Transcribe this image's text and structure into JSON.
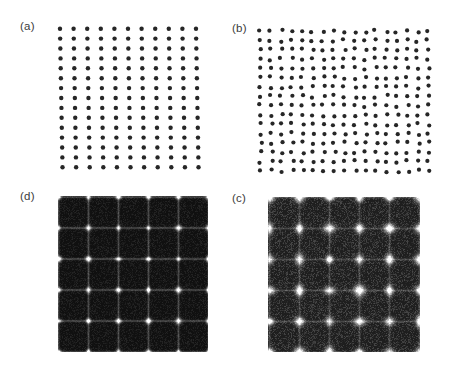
{
  "figure": {
    "background_color": "#ffffff",
    "label_color": "#3b3b3b",
    "dot_color": "#262626",
    "panel_order": [
      "a",
      "b",
      "d",
      "c"
    ]
  },
  "panels": {
    "a": {
      "label": "(a)",
      "kind": "real-space-lattice",
      "caption_position": "top-left",
      "description": "regular square lattice of dark circular dots",
      "bounds": {
        "x": 54,
        "y": 22,
        "width": 148,
        "height": 152
      },
      "dot_color": "#262626",
      "background_color": "#ffffff"
    },
    "b": {
      "label": "(b)",
      "kind": "real-space-lattice",
      "caption_position": "top-left",
      "description": "denser, slightly disordered square lattice of dark circular dots",
      "bounds": {
        "x": 254,
        "y": 24,
        "width": 180,
        "height": 154
      },
      "dot_color": "#262626",
      "background_color": "#ffffff"
    },
    "d": {
      "label": "(d)",
      "kind": "fourier-transform",
      "caption_position": "top-left",
      "description": "dark diffraction pattern with sharp bright Bragg peaks on a square grid joined by faint streak lines",
      "bounds": {
        "x": 58,
        "y": 196,
        "width": 150,
        "height": 156
      },
      "background_color": "#070707",
      "peak_color": "#ffffff"
    },
    "c": {
      "label": "(c)",
      "kind": "fourier-transform",
      "caption_position": "top-left",
      "description": "dark diffraction pattern with diffuse, smeared peaks on a square grid and a grainier background",
      "bounds": {
        "x": 268,
        "y": 197,
        "width": 152,
        "height": 155
      },
      "background_color": "#0d0d0d",
      "peak_color": "#f2f2f2"
    }
  },
  "chart_data": {
    "type": "scatter",
    "title": "",
    "xlabel": "",
    "ylabel": "",
    "subplots": [
      {
        "id": "a",
        "label": "(a)",
        "type": "scatter",
        "description": "Regular 2D square point lattice, slight global tilt",
        "lattice": {
          "columns": 11,
          "rows": 15,
          "spacing_x": 13.6,
          "spacing_y": 9.9,
          "shear_per_row": 0.18,
          "jitter": 0.0,
          "dot_radius": 2.2
        },
        "xlim": [
          0,
          148
        ],
        "ylim": [
          0,
          152
        ],
        "grid": false
      },
      {
        "id": "b",
        "label": "(b)",
        "type": "scatter",
        "description": "Denser square point lattice with random positional disorder",
        "lattice": {
          "columns": 17,
          "rows": 16,
          "spacing_x": 10.5,
          "spacing_y": 9.3,
          "shear_per_row": 0.06,
          "jitter": 1.5,
          "dot_radius": 2.1
        },
        "xlim": [
          0,
          180
        ],
        "ylim": [
          0,
          154
        ],
        "grid": false
      },
      {
        "id": "d",
        "label": "(d)",
        "type": "heatmap",
        "description": "Fourier transform of (a): sharp bright peaks on a 6x6 reciprocal grid",
        "peak_grid": {
          "columns": 6,
          "rows": 6,
          "spacing_x": 30,
          "spacing_y": 31
        },
        "peak_sigma": 1.6,
        "streak_intensity": 0.22,
        "noise_level": 0.1,
        "xlim": [
          0,
          150
        ],
        "ylim": [
          0,
          156
        ],
        "grid": false
      },
      {
        "id": "c",
        "label": "(c)",
        "type": "heatmap",
        "description": "Fourier transform of (b): diffuse broadened peaks on a 6x6 reciprocal grid with higher background",
        "peak_grid": {
          "columns": 6,
          "rows": 6,
          "spacing_x": 30,
          "spacing_y": 31
        },
        "peak_sigma": 2.8,
        "streak_intensity": 0.16,
        "noise_level": 0.2,
        "xlim": [
          0,
          152
        ],
        "ylim": [
          0,
          155
        ],
        "grid": false
      }
    ]
  }
}
